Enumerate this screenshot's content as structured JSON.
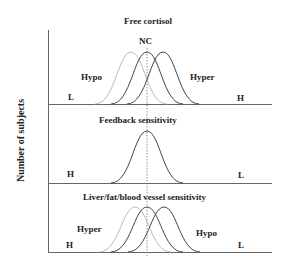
{
  "y_axis_label": "Number of subjects",
  "panels": [
    {
      "title": "Free cortisol",
      "center_label": "NC",
      "left_group": "Hypo",
      "right_group": "Hyper",
      "left_end": "L",
      "right_end": "H",
      "curves": 3
    },
    {
      "title": "Feedback sensitivity",
      "left_end": "H",
      "right_end": "L",
      "curves": 1
    },
    {
      "title": "Liver/fat/blood vessel  sensitivity",
      "left_group": "Hyper",
      "right_group": "Hypo",
      "left_end": "H",
      "right_end": "L",
      "curves": 3
    }
  ],
  "colors": {
    "axis": "#555555",
    "curve_dark": "#444444",
    "curve_light": "#bbbbbb"
  }
}
